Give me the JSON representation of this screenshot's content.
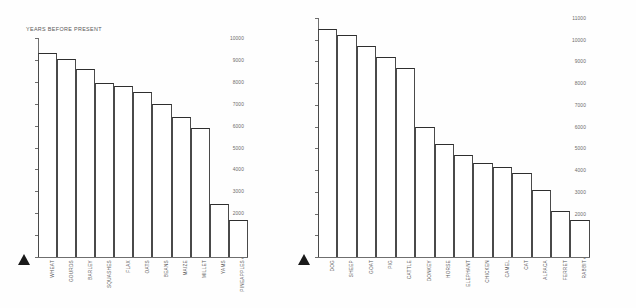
{
  "figure": {
    "background": "#fefefe",
    "axis_color": "#6e6e6e",
    "bar_outline_color": "#2e2e2e",
    "bar_fill_color": "#ffffff"
  },
  "chart_data": [
    {
      "type": "bar",
      "name": "crops",
      "title": "YEARS BEFORE PRESENT",
      "xlabel": "",
      "ylabel": "YEARS BEFORE PRESENT",
      "ylim": [
        0,
        10000
      ],
      "ytick_step": 1000,
      "grid": false,
      "legend": "none",
      "ytick_labels": [
        "0",
        "1,000",
        "2000",
        "3000",
        "4000",
        "5000",
        "6000",
        "7000",
        "8000",
        "9000",
        "10000"
      ],
      "ytick_values": [
        0,
        1000,
        2000,
        3000,
        4000,
        5000,
        6000,
        7000,
        8000,
        9000,
        10000
      ],
      "categories": [
        "WHEAT",
        "GOURDS",
        "BARLEY",
        "SQUASHES",
        "FLAX",
        "OATS",
        "BEANS",
        "MAIZE",
        "MILLET",
        "YAMS",
        "PINEAPPLES"
      ],
      "values": [
        9300,
        9050,
        8600,
        7950,
        7800,
        7550,
        7000,
        6400,
        5900,
        2400,
        1700
      ]
    },
    {
      "type": "bar",
      "name": "animals",
      "title": "",
      "xlabel": "",
      "ylabel": "",
      "ylim": [
        0,
        11000
      ],
      "ytick_step": 1000,
      "grid": false,
      "legend": "none",
      "ytick_labels": [
        "0",
        "1,000",
        "2000",
        "3000",
        "4000",
        "5000",
        "6000",
        "7000",
        "8000",
        "9000",
        "10000",
        "11000"
      ],
      "ytick_values": [
        0,
        1000,
        2000,
        3000,
        4000,
        5000,
        6000,
        7000,
        8000,
        9000,
        10000,
        11000
      ],
      "categories": [
        "DOG",
        "SHEEP",
        "GOAT",
        "PIG",
        "CATTLE",
        "DONKEY",
        "HORSE",
        "ELEPHANT",
        "CHICKEN",
        "CAMEL",
        "CAT",
        "ALPACA",
        "FERRET",
        "RABBIT"
      ],
      "values": [
        10500,
        10200,
        9700,
        9200,
        8700,
        6000,
        5200,
        4700,
        4350,
        4150,
        3850,
        3100,
        2100,
        1700
      ]
    }
  ],
  "markers": {
    "crops_origin_marker": "triangle-up",
    "animals_origin_marker": "triangle-up"
  }
}
